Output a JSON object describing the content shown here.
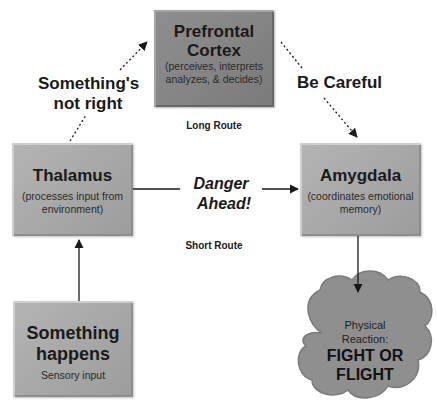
{
  "diagram": {
    "nodes": {
      "prefrontal": {
        "title_line1": "Prefrontal",
        "title_line2": "Cortex",
        "desc_line1": "(perceives, interprets",
        "desc_line2": "analyzes, & decides)"
      },
      "thalamus": {
        "title": "Thalamus",
        "desc_line1": "(processes input from",
        "desc_line2": "environment)"
      },
      "amygdala": {
        "title": "Amygdala",
        "desc_line1": "(coordinates emotional",
        "desc_line2": "memory)"
      },
      "something_happens": {
        "title_line1": "Something",
        "title_line2": "happens",
        "desc": "Sensory input"
      },
      "physical_reaction": {
        "sub_line1": "Physical",
        "sub_line2": "Reaction:",
        "title_line1": "FIGHT OR",
        "title_line2": "FLIGHT"
      }
    },
    "edge_labels": {
      "somethings_not_right_line1": "Something's",
      "somethings_not_right_line2": "not right",
      "be_careful": "Be Careful",
      "long_route": "Long Route",
      "danger_line1": "Danger",
      "danger_line2": "Ahead!",
      "short_route": "Short Route"
    },
    "colors": {
      "box_fill": "#a8a8a8",
      "prefrontal_fill": "#858585",
      "cloud_fill": "#8f8f8f",
      "line": "#1a1a1a"
    }
  }
}
